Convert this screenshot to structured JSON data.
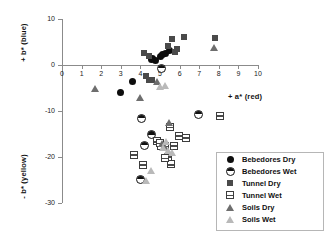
{
  "chart_data": {
    "type": "scatter",
    "title": "",
    "xlabel": "+ a* (red)",
    "ylabel_top": "+ b* (blue)",
    "ylabel_bottom": "- b* (yellow)",
    "xlim": [
      0,
      10
    ],
    "ylim": [
      -30,
      10
    ],
    "xticks": [
      "0",
      "1",
      "2",
      "3",
      "4",
      "5",
      "6",
      "7",
      "8",
      "9",
      "10"
    ],
    "yticks": [
      "10",
      "0",
      "-10",
      "-20",
      "-30"
    ],
    "grid": false,
    "legend_position": "bottom-right",
    "series": [
      {
        "name": "Bebedores Dry",
        "marker": "circle-dry",
        "points": [
          [
            3.0,
            -5.9
          ],
          [
            3.6,
            -3.5
          ],
          [
            4.6,
            1.4
          ],
          [
            4.75,
            0.9
          ],
          [
            5.0,
            1.9
          ],
          [
            5.15,
            2.2
          ],
          [
            5.3,
            2.6
          ],
          [
            5.5,
            3.2
          ],
          [
            4.55,
            1.2
          ]
        ]
      },
      {
        "name": "Bebedores Wet",
        "marker": "circle-wet",
        "points": [
          [
            4.0,
            -11.4
          ],
          [
            4.5,
            -14.9
          ],
          [
            5.0,
            -0.5
          ],
          [
            6.9,
            -10.5
          ],
          [
            3.95,
            -24.6
          ],
          [
            4.15,
            -17.2
          ]
        ]
      },
      {
        "name": "Tunnel Dry",
        "marker": "square-dry",
        "points": [
          [
            4.2,
            2.6
          ],
          [
            4.45,
            1.9
          ],
          [
            5.4,
            4.2
          ],
          [
            5.6,
            5.6
          ],
          [
            6.2,
            6.0
          ],
          [
            5.85,
            3.4
          ],
          [
            7.8,
            5.9
          ],
          [
            4.3,
            -2.4
          ],
          [
            4.45,
            -3.2
          ],
          [
            4.6,
            -3.3
          ],
          [
            5.75,
            2.9
          ]
        ]
      },
      {
        "name": "Tunnel Wet",
        "marker": "square-wet",
        "points": [
          [
            3.6,
            -19.3
          ],
          [
            4.1,
            -21.5
          ],
          [
            4.8,
            -16.4
          ],
          [
            5.0,
            -17.3
          ],
          [
            5.2,
            -17.4
          ],
          [
            5.35,
            -19.7
          ],
          [
            5.5,
            -21.4
          ],
          [
            5.65,
            -17.3
          ],
          [
            5.9,
            -15.2
          ],
          [
            6.3,
            -15.6
          ],
          [
            8.0,
            -10.8
          ],
          [
            4.95,
            -16.8
          ],
          [
            5.2,
            -20.0
          ],
          [
            5.45,
            -13.3
          ]
        ]
      },
      {
        "name": "Soils Dry",
        "marker": "tri-dry",
        "points": [
          [
            1.7,
            -5.0
          ],
          [
            4.0,
            -7.0
          ],
          [
            4.85,
            -3.6
          ],
          [
            5.45,
            -12.5
          ],
          [
            5.1,
            -17.0
          ],
          [
            5.25,
            -17.9
          ],
          [
            7.75,
            3.8
          ]
        ]
      },
      {
        "name": "Soils Wet",
        "marker": "tri-wet",
        "points": [
          [
            4.3,
            -25.2
          ],
          [
            4.55,
            -22.9
          ],
          [
            5.0,
            -4.6
          ],
          [
            5.25,
            -4.5
          ],
          [
            5.3,
            -16.6
          ],
          [
            5.4,
            -18.6
          ],
          [
            5.6,
            -19.0
          ],
          [
            5.15,
            -18.0
          ]
        ]
      }
    ]
  },
  "legend": {
    "items": [
      {
        "label": "Bebedores Dry",
        "marker": "circle-dry"
      },
      {
        "label": "Bebedores Wet",
        "marker": "circle-wet"
      },
      {
        "label": "Tunnel Dry",
        "marker": "square-dry"
      },
      {
        "label": "Tunnel Wet",
        "marker": "square-wet"
      },
      {
        "label": "Soils Dry",
        "marker": "tri-dry"
      },
      {
        "label": "Soils Wet",
        "marker": "tri-wet"
      }
    ]
  },
  "colors": {
    "axis": "#8b8b8b",
    "text": "#111111",
    "background": "#ffffff",
    "dry_dark": "#4a4a4a",
    "wet_light": "#b9b9b9"
  }
}
